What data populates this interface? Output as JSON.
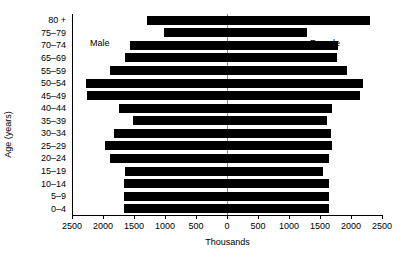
{
  "chart_data": {
    "type": "bar",
    "subtype": "population-pyramid",
    "title": "",
    "xlabel": "Thousands",
    "ylabel": "Age (years)",
    "orientation": "horizontal",
    "grid": false,
    "legend_position": "inside-plot",
    "axis_center_value": 0,
    "xlim": [
      -2500,
      2500
    ],
    "xticks_display": [
      "2500",
      "2000",
      "1500",
      "1000",
      "500",
      "0",
      "500",
      "1000",
      "1500",
      "2000",
      "2500"
    ],
    "xticks_value": [
      -2500,
      -2000,
      -1500,
      -1000,
      -500,
      0,
      500,
      1000,
      1500,
      2000,
      2500
    ],
    "categories": [
      "80 +",
      "75–79",
      "70–74",
      "65–69",
      "55–59",
      "50–54",
      "45–49",
      "40–44",
      "35–39",
      "30–34",
      "25–29",
      "20–24",
      "15–19",
      "10–14",
      "5–9",
      "0–4"
    ],
    "series": [
      {
        "name": "Male",
        "side": "left",
        "color": "#000000",
        "values": [
          1290,
          1010,
          1560,
          1640,
          1880,
          2280,
          2260,
          1750,
          1510,
          1830,
          1960,
          1890,
          1650,
          1660,
          1660,
          1660
        ]
      },
      {
        "name": "Female",
        "side": "right",
        "color": "#000000",
        "values": [
          2310,
          1285,
          1790,
          1780,
          1930,
          2200,
          2140,
          1700,
          1620,
          1680,
          1700,
          1650,
          1550,
          1640,
          1640,
          1640
        ]
      }
    ],
    "annotations": [
      {
        "text": "Male",
        "position": "upper-left"
      },
      {
        "text": "Female",
        "position": "upper-right"
      }
    ]
  },
  "colors": {
    "bar": "#000000",
    "axis": "#000000",
    "center_line": "#8a8a8a",
    "background": "#ffffff"
  }
}
